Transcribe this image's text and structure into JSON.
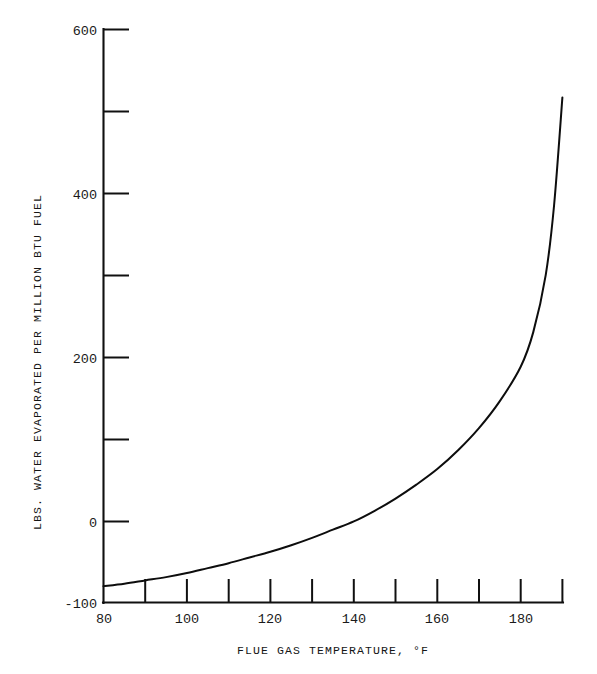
{
  "chart_data": {
    "type": "line",
    "title": "",
    "xlabel": "FLUE GAS TEMPERATURE, °F",
    "ylabel": "LBS. WATER EVAPORATED PER MILLION BTU FUEL",
    "xlim": [
      80,
      190
    ],
    "ylim": [
      -100,
      600
    ],
    "grid": false,
    "legend": null,
    "x_tick_values": [
      80,
      90,
      100,
      110,
      120,
      130,
      140,
      150,
      160,
      170,
      180,
      190
    ],
    "x_tick_labels": [
      "80",
      "",
      "100",
      "",
      "120",
      "",
      "140",
      "",
      "160",
      "",
      "180",
      ""
    ],
    "x_labeled_ticks": [
      {
        "value": 80,
        "label": "80"
      },
      {
        "value": 100,
        "label": "100"
      },
      {
        "value": 120,
        "label": "120"
      },
      {
        "value": 140,
        "label": "140"
      },
      {
        "value": 160,
        "label": "160"
      },
      {
        "value": 180,
        "label": "180"
      }
    ],
    "y_tick_values": [
      -100,
      0,
      100,
      200,
      300,
      400,
      500,
      600
    ],
    "y_labeled_ticks": [
      {
        "value": -100,
        "label": "-100"
      },
      {
        "value": 0,
        "label": "0"
      },
      {
        "value": 200,
        "label": "200"
      },
      {
        "value": 400,
        "label": "400"
      },
      {
        "value": 600,
        "label": "600"
      }
    ],
    "y_unlabeled_ticks": [
      100,
      300,
      500
    ],
    "x": [
      80,
      85,
      90,
      95,
      100,
      105,
      110,
      115,
      120,
      125,
      130,
      135,
      140,
      145,
      150,
      155,
      160,
      165,
      170,
      175,
      180,
      183,
      186,
      188,
      190
    ],
    "values": [
      -80,
      -77,
      -73,
      -69,
      -64,
      -58,
      -52,
      -45,
      -38,
      -30,
      -21,
      -11,
      -1,
      12,
      27,
      44,
      63,
      86,
      113,
      146,
      188,
      230,
      300,
      385,
      517
    ],
    "series": [
      {
        "name": "water evaporated vs flue gas temperature",
        "values": [
          -80,
          -77,
          -73,
          -69,
          -64,
          -58,
          -52,
          -45,
          -38,
          -30,
          -21,
          -11,
          -1,
          12,
          27,
          44,
          63,
          86,
          113,
          146,
          188,
          230,
          300,
          385,
          517
        ],
        "color": "#0d0d0d"
      }
    ],
    "annotations": []
  },
  "figure": {
    "background_color": "#ffffff",
    "axis_color": "#101010",
    "curve_color": "#0d0d0d"
  }
}
